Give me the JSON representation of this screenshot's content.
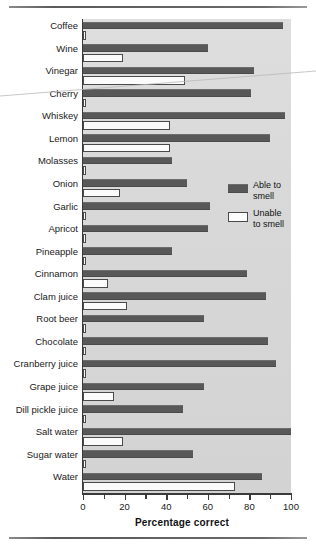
{
  "chart_data": {
    "type": "bar",
    "orientation": "horizontal",
    "title": "",
    "xlabel": "Percentage correct",
    "ylabel": "",
    "xlim": [
      0,
      100
    ],
    "xticks": [
      0,
      20,
      40,
      60,
      80,
      100
    ],
    "minor_ticks": [
      10,
      30,
      50,
      70,
      90
    ],
    "grid": false,
    "legend_position": "middle-right",
    "categories": [
      "Coffee",
      "Wine",
      "Vinegar",
      "Cherry",
      "Whiskey",
      "Lemon",
      "Molasses",
      "Onion",
      "Garlic",
      "Apricot",
      "Pineapple",
      "Cinnamon",
      "Clam juice",
      "Root beer",
      "Chocolate",
      "Cranberry juice",
      "Grape juice",
      "Dill pickle juice",
      "Salt water",
      "Sugar water",
      "Water"
    ],
    "series": [
      {
        "name": "Able to smell",
        "color": "#585858",
        "values": [
          96,
          60,
          82,
          81,
          97,
          90,
          43,
          50,
          61,
          60,
          43,
          79,
          88,
          58,
          89,
          93,
          58,
          48,
          100,
          53,
          86
        ]
      },
      {
        "name": "Unable to smell",
        "color": "#ffffff",
        "values": [
          1,
          19,
          49,
          1,
          42,
          42,
          1,
          18,
          1,
          1,
          1,
          12,
          21,
          1,
          1,
          1,
          15,
          1,
          19,
          1,
          73
        ]
      }
    ]
  },
  "legend": {
    "items": [
      {
        "label_line1": "Able to",
        "label_line2": "smell",
        "swatch": "filled-dark"
      },
      {
        "label_line1": "Unable",
        "label_line2": "to smell",
        "swatch": "outlined-white"
      }
    ]
  },
  "axis": {
    "x_title": "Percentage correct",
    "x_tick_labels": [
      "0",
      "20",
      "40",
      "60",
      "80",
      "100"
    ]
  }
}
